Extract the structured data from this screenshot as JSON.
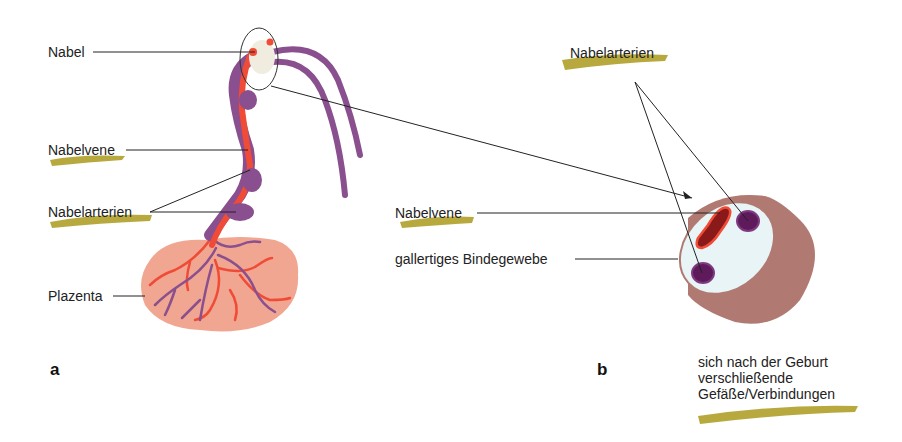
{
  "figure": {
    "panel_a": {
      "panel_label": "a",
      "labels": {
        "nabel": "Nabel",
        "nabelvene": "Nabelvene",
        "nabelarterien": "Nabelarterien",
        "plazenta": "Plazenta"
      }
    },
    "panel_b": {
      "panel_label": "b",
      "labels": {
        "nabelarterien": "Nabelarterien",
        "nabelvene": "Nabelvene",
        "bindegewebe": "gallertiges Bindegewebe"
      }
    },
    "legend": {
      "line1": "sich nach der Geburt",
      "line2": "verschließende",
      "line3": "Gefäße/Verbindungen"
    },
    "colors": {
      "artery_purple": "#8a4f8e",
      "vein_red": "#f04b36",
      "placenta": "#f0a690",
      "highlight_marker": "#b0a02a",
      "cord_tissue": "#b07a72",
      "jelly": "#e8f4f6",
      "vein_section": "#8a1a1a",
      "artery_section": "#5e1a5a"
    }
  }
}
